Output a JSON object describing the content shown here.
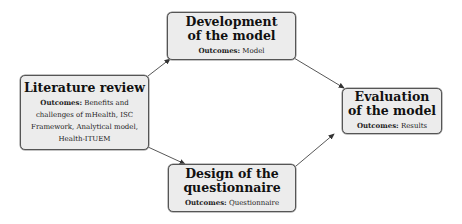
{
  "diagram": {
    "nodes": [
      {
        "id": "literature",
        "title": "Literature review",
        "outcome_label": "Outcomes:",
        "outcome_text": "Benefits and challenges of mHealth, ISC Framework, Analytical model, Health-ITUEM"
      },
      {
        "id": "development",
        "title_line1": "Development",
        "title_line2": "of the model",
        "outcome_label": "Outcomes:",
        "outcome_text": "Model"
      },
      {
        "id": "design",
        "title_line1": "Design of the",
        "title_line2": "questionnaire",
        "outcome_label": "Outcomes:",
        "outcome_text": "Questionnaire"
      },
      {
        "id": "evaluation",
        "title_line1": "Evaluation",
        "title_line2": "of the model",
        "outcome_label": "Outcomes:",
        "outcome_text": "Results"
      }
    ],
    "edges": [
      {
        "from": "literature",
        "to": "development"
      },
      {
        "from": "literature",
        "to": "design"
      },
      {
        "from": "development",
        "to": "evaluation"
      },
      {
        "from": "design",
        "to": "evaluation"
      }
    ],
    "colors": {
      "box_fill": "#ececec",
      "box_border": "#555555",
      "arrow": "#333333"
    }
  }
}
